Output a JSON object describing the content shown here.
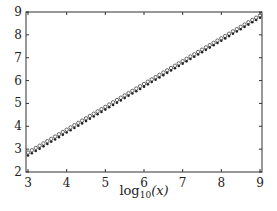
{
  "chart_data": {
    "type": "scatter",
    "title": "",
    "xlabel": "log10(x)",
    "ylabel": "",
    "xlim": [
      3,
      9
    ],
    "ylim": [
      2,
      9
    ],
    "xticks": [
      3,
      4,
      5,
      6,
      7,
      8,
      9
    ],
    "yticks": [
      2,
      3,
      4,
      5,
      6,
      7,
      8,
      9
    ],
    "grid": false,
    "legend": null,
    "series": [
      {
        "name": "open-circles",
        "marker": "open-circle",
        "x_start": 3,
        "x_end": 9,
        "y_start": 2.85,
        "y_end": 8.85,
        "slope": 1.0,
        "n_points": 61
      },
      {
        "name": "filled-dots",
        "marker": "filled-circle",
        "x_start": 3,
        "x_end": 9,
        "y_start": 2.72,
        "y_end": 8.75,
        "slope": 1.0,
        "n_points": 61
      }
    ]
  },
  "labels": {
    "xlabel_main": "log",
    "xlabel_sub": "10",
    "xlabel_arg": "(x)"
  }
}
